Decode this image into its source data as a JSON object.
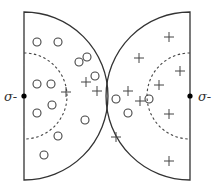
{
  "diagram": {
    "colors": {
      "stroke": "#333333",
      "marker": "#444444",
      "dashed": "#444444",
      "background": "#ffffff"
    },
    "left_half": {
      "center": [
        24,
        96
      ],
      "radius": 84,
      "inner_radius": 43,
      "label": "σ-",
      "label_pos": [
        4,
        101
      ],
      "circles": [
        [
          37,
          42
        ],
        [
          58,
          42
        ],
        [
          37,
          84
        ],
        [
          51,
          84
        ],
        [
          52,
          105
        ],
        [
          37,
          113
        ],
        [
          58,
          136
        ],
        [
          44,
          155
        ],
        [
          79,
          62
        ],
        [
          87,
          57
        ],
        [
          95,
          76
        ],
        [
          85,
          120
        ]
      ],
      "pluses": [
        [
          66,
          92
        ],
        [
          86,
          82
        ],
        [
          97,
          91
        ]
      ]
    },
    "right_half": {
      "center": [
        190,
        96
      ],
      "radius": 84,
      "inner_radius": 43,
      "label": "σ-",
      "label_pos": [
        198,
        101
      ],
      "circles": [
        [
          116,
          99
        ],
        [
          149,
          99
        ],
        [
          128,
          113
        ]
      ],
      "pluses": [
        [
          169,
          37
        ],
        [
          180,
          71
        ],
        [
          159,
          85
        ],
        [
          139,
          58
        ],
        [
          128,
          91
        ],
        [
          140,
          101
        ],
        [
          169,
          114
        ],
        [
          169,
          161
        ],
        [
          116,
          137
        ]
      ]
    },
    "marker_radius": 4,
    "plus_half": 5
  }
}
